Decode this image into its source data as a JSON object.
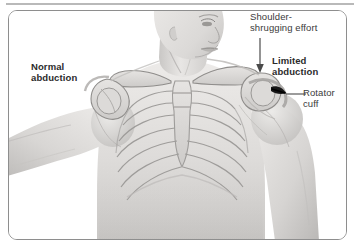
{
  "labels": {
    "normal_abduction": "Normal\nabduction",
    "limited_abduction": "Limited\nabduction",
    "shoulder_shrug": "Shoulder-\nshrugging effort",
    "rotator_cuff": "Rotator\ncuff"
  },
  "annotations": {
    "shrug_arrow_name": "down-arrow",
    "rotator_leader_name": "leader-line"
  },
  "colors": {
    "frame_border": "#8e8e8e",
    "top_rule": "#b9b9b9",
    "text": "#2b2b2b",
    "text_plain": "#3a3a3a",
    "skin_light": "#e4e2e0",
    "skin_mid": "#cfcdcb",
    "skin_shadow": "#b0aeac",
    "bone_light": "#dedcda",
    "bone_outline": "#9b9997",
    "tear_dark": "#171717",
    "background": "#ffffff"
  }
}
